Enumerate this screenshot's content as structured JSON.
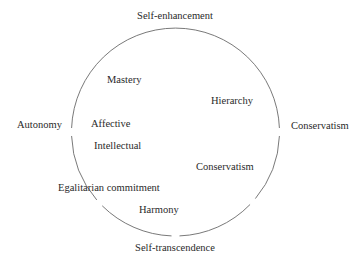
{
  "diagram": {
    "type": "circumplex",
    "stroke_color": "#6a6a6a",
    "text_color": "#2a2a2a",
    "poles": {
      "top": "Self-enhancement",
      "bottom": "Self-transcendence",
      "left": "Autonomy",
      "right": "Conservatism"
    },
    "inner_labels": [
      {
        "id": "mastery",
        "text": "Mastery"
      },
      {
        "id": "hierarchy",
        "text": "Hierarchy"
      },
      {
        "id": "affective",
        "text": "Affective"
      },
      {
        "id": "intellectual",
        "text": "Intellectual"
      },
      {
        "id": "conservatism",
        "text": "Conservatism"
      },
      {
        "id": "egalitarian-commitment",
        "text": "Egalitarian commitment"
      },
      {
        "id": "harmony",
        "text": "Harmony"
      }
    ]
  }
}
